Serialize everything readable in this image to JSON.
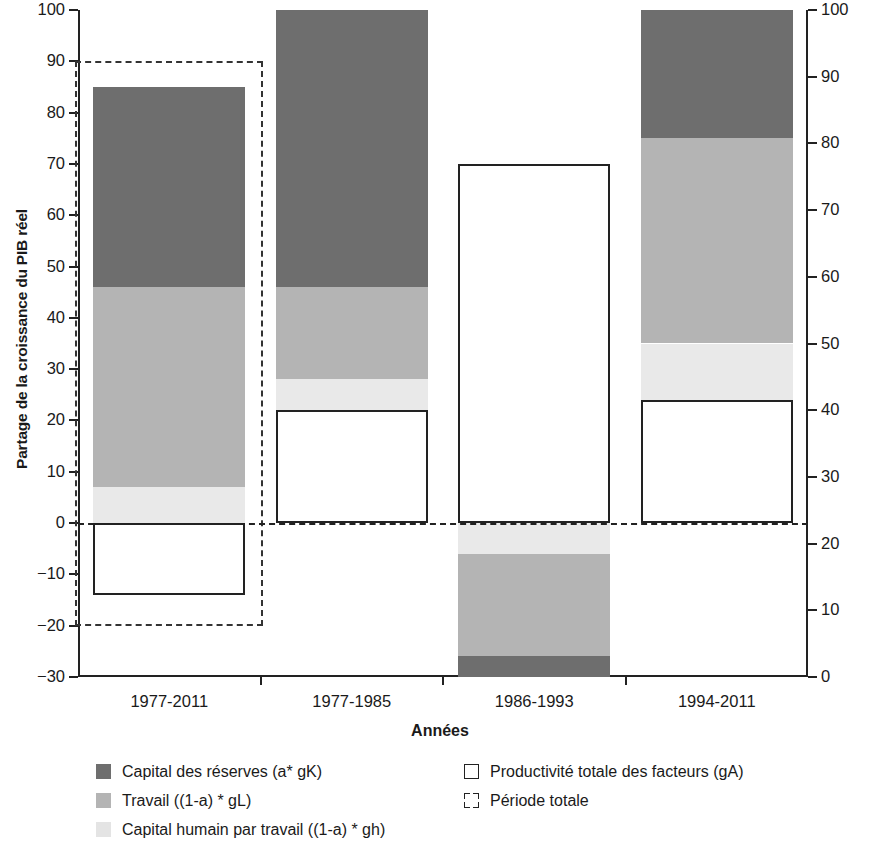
{
  "chart_data": {
    "type": "bar",
    "subtype": "stacked-bar-with-overlay",
    "title": "",
    "xlabel": "Années",
    "ylabel": "Partage de la croissance du PIB réel",
    "ylabel_right": "",
    "categories": [
      "1977-2011",
      "1977-1985",
      "1986-1993",
      "1994-2011"
    ],
    "ylim": [
      -30,
      100
    ],
    "yticks": [
      -30,
      -20,
      -10,
      0,
      10,
      20,
      30,
      40,
      50,
      60,
      70,
      80,
      90,
      100
    ],
    "ylim_right": [
      0,
      100
    ],
    "yticks_right": [
      0,
      10,
      20,
      30,
      40,
      50,
      60,
      70,
      80,
      90,
      100
    ],
    "grid": false,
    "legend_position": "below-plot",
    "zero_reference_line": true,
    "series": [
      {
        "name": "Capital des réserves (a* gK)",
        "key": "capital",
        "color": "#6e6e6e",
        "swatch": "dark",
        "values": [
          39,
          54,
          -4,
          25
        ],
        "ranges": [
          [
            46,
            85
          ],
          [
            46,
            100
          ],
          [
            -30,
            -26
          ],
          [
            75,
            100
          ]
        ]
      },
      {
        "name": "Travail ((1-a) * gL)",
        "key": "travail",
        "color": "#b4b4b4",
        "swatch": "medium",
        "values": [
          39,
          18,
          -20,
          40
        ],
        "ranges": [
          [
            7,
            46
          ],
          [
            28,
            46
          ],
          [
            -26,
            -6
          ],
          [
            35,
            75
          ]
        ]
      },
      {
        "name": "Capital humain par travail ((1-a) * gh)",
        "key": "capital-humain",
        "color": "#e9e9e9",
        "swatch": "light",
        "values": [
          7,
          6,
          -6,
          11
        ],
        "ranges": [
          [
            0,
            7
          ],
          [
            22,
            28
          ],
          [
            -6,
            0
          ],
          [
            24,
            35
          ]
        ]
      },
      {
        "name": "Productivité totale des facteurs (gA)",
        "key": "ptf",
        "color": "#ffffff",
        "swatch": "open",
        "values": [
          -14,
          22,
          70,
          24
        ],
        "ranges": [
          [
            -14,
            0
          ],
          [
            0,
            22
          ],
          [
            0,
            70
          ],
          [
            0,
            24
          ]
        ]
      }
    ],
    "annotations": [
      {
        "name": "Période totale",
        "key": "periode-totale",
        "style": "dashed-rectangle",
        "category": "1977-2011",
        "y_range": [
          -20,
          90
        ]
      }
    ]
  },
  "axis": {
    "left_ticks": [
      "100",
      "90",
      "80",
      "70",
      "60",
      "50",
      "40",
      "30",
      "20",
      "10",
      "0",
      "-10",
      "-20",
      "-30"
    ],
    "right_ticks": [
      "100",
      "90",
      "80",
      "70",
      "60",
      "50",
      "40",
      "30",
      "20",
      "10",
      "0"
    ],
    "ylabel": "Partage de la croissance du PIB réel",
    "xlabel": "Années",
    "categories": [
      "1977-2011",
      "1977-1985",
      "1986-1993",
      "1994-2011"
    ]
  },
  "legend": {
    "column_1": [
      {
        "label": "Capital des réserves (a* gK)",
        "swatch": "dark"
      },
      {
        "label": "Travail ((1-a) * gL)",
        "swatch": "medium"
      },
      {
        "label": "Capital humain par travail ((1-a) * gh)",
        "swatch": "light"
      }
    ],
    "column_2": [
      {
        "label": "Productivité totale des facteurs (gA)",
        "swatch": "open"
      },
      {
        "label": "Période totale",
        "swatch": "dashed"
      }
    ]
  },
  "colors": {
    "dark_gray": "#6e6e6e",
    "medium_gray": "#b4b4b4",
    "light_gray": "#e9e9e9",
    "outline": "#222222",
    "background": "#ffffff"
  }
}
